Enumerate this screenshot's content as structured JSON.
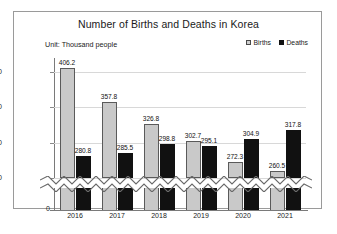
{
  "chart": {
    "title": "Number of Births and Deaths in Korea",
    "unit_note": "Unit: Thousand people",
    "legend": [
      {
        "label": "Births",
        "color": "#c9c9c9"
      },
      {
        "label": "Deaths",
        "color": "#111111"
      }
    ]
  },
  "chart_data": {
    "type": "bar",
    "title": "Number of Births and Deaths in Korea",
    "subtitle": "Unit: Thousand people",
    "xlabel": "",
    "ylabel": "",
    "categories": [
      "2016",
      "2017",
      "2018",
      "2019",
      "2020",
      "2021"
    ],
    "series": [
      {
        "name": "Births",
        "color": "#c9c9c9",
        "values": [
          406.2,
          357.8,
          326.8,
          302.7,
          272.3,
          260.5
        ]
      },
      {
        "name": "Deaths",
        "color": "#111111",
        "values": [
          280.8,
          285.5,
          298.8,
          295.1,
          304.9,
          317.8
        ]
      }
    ],
    "yticks": [
      0,
      250,
      300,
      350,
      400
    ],
    "ylim": [
      250,
      420
    ],
    "axis_break": true,
    "axis_break_between": [
      0,
      250
    ],
    "grid": true,
    "legend_position": "top-right"
  }
}
